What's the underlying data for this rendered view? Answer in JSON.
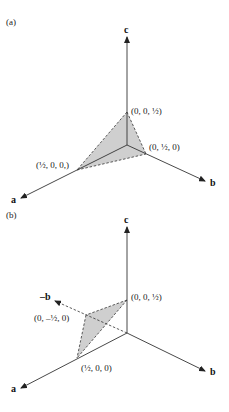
{
  "panels": [
    {
      "id": "a",
      "label": "(a)",
      "axes": {
        "a": "a",
        "b": "b",
        "c": "c"
      },
      "points": [
        {
          "name": "c-intercept",
          "text": "(0, 0, ½)"
        },
        {
          "name": "b-intercept",
          "text": "(0, ½, 0)"
        },
        {
          "name": "a-intercept",
          "text": "(½, 0, 0,)"
        }
      ]
    },
    {
      "id": "b",
      "label": "(b)",
      "axes": {
        "a": "a",
        "b": "b",
        "c": "c",
        "neg_b": "–b"
      },
      "points": [
        {
          "name": "c-intercept",
          "text": "(0, 0, ½)"
        },
        {
          "name": "neg-b-intercept",
          "text": "(0, –½, 0)"
        },
        {
          "name": "a-intercept",
          "text": "(½, 0, 0)"
        }
      ]
    }
  ],
  "colors": {
    "face": "#cfcfcf",
    "line": "#333333"
  }
}
